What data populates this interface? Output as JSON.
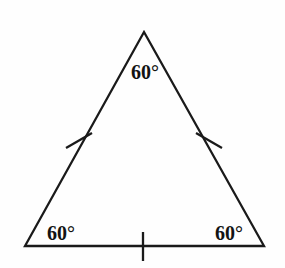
{
  "figure": {
    "name": "equilateral-triangle-diagram",
    "width": 285,
    "height": 268,
    "background_color": "#fefefe",
    "stroke_color": "#1a1a1a",
    "stroke_width": 2.3,
    "vertices": {
      "apex": {
        "x": 144,
        "y": 32
      },
      "bottom_left": {
        "x": 25,
        "y": 246
      },
      "bottom_right": {
        "x": 264,
        "y": 246
      }
    },
    "angle_labels": [
      {
        "id": "apex-angle",
        "text": "60°",
        "x": 145,
        "y": 79
      },
      {
        "id": "bottom-left-angle",
        "text": "60°",
        "x": 61,
        "y": 240
      },
      {
        "id": "bottom-right-angle",
        "text": "60°",
        "x": 229,
        "y": 240
      }
    ],
    "tick_marks": [
      {
        "id": "left-side-tick",
        "x1": 66,
        "y1": 148,
        "x2": 92,
        "y2": 133
      },
      {
        "id": "right-side-tick",
        "x1": 196,
        "y1": 133,
        "x2": 222,
        "y2": 148
      },
      {
        "id": "base-tick",
        "x1": 143,
        "y1": 232,
        "x2": 143,
        "y2": 261
      }
    ]
  }
}
